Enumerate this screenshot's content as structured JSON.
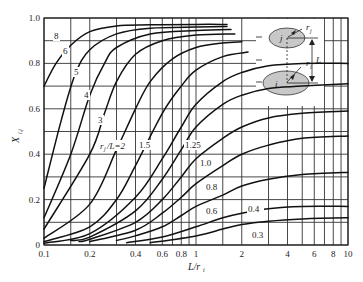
{
  "chart_data": {
    "type": "line",
    "title": "",
    "xlabel": "L/r_i",
    "ylabel": "X_i,j",
    "xscale": "log",
    "xlim": [
      0.1,
      10
    ],
    "ylim": [
      0,
      1.0
    ],
    "x_ticks": [
      "0.1",
      "0.2",
      "0.4",
      "0.6",
      "0.8",
      "1",
      "2",
      "4",
      "6",
      "8",
      "10"
    ],
    "y_ticks": [
      "0",
      "0.2",
      "0.4",
      "0.6",
      "0.8",
      "1.0"
    ],
    "grid": true,
    "legend_title": "r_j/L=2",
    "series": [
      {
        "name": "8",
        "x": [
          0.1,
          0.12,
          0.15,
          0.2,
          0.3,
          0.5,
          1,
          1.6
        ],
        "y": [
          0.7,
          0.8,
          0.88,
          0.94,
          0.965,
          0.97,
          0.972,
          0.972
        ]
      },
      {
        "name": "6",
        "x": [
          0.1,
          0.13,
          0.16,
          0.2,
          0.3,
          0.5,
          1,
          1.6
        ],
        "y": [
          0.25,
          0.55,
          0.75,
          0.86,
          0.93,
          0.955,
          0.96,
          0.962
        ]
      },
      {
        "name": "5",
        "x": [
          0.1,
          0.15,
          0.2,
          0.25,
          0.3,
          0.5,
          1,
          1.7
        ],
        "y": [
          0.12,
          0.4,
          0.66,
          0.8,
          0.87,
          0.93,
          0.945,
          0.95
        ]
      },
      {
        "name": "4",
        "x": [
          0.1,
          0.2,
          0.25,
          0.3,
          0.4,
          0.6,
          1,
          1.8
        ],
        "y": [
          0.07,
          0.4,
          0.58,
          0.72,
          0.84,
          0.9,
          0.925,
          0.93
        ]
      },
      {
        "name": "3",
        "x": [
          0.1,
          0.2,
          0.3,
          0.4,
          0.5,
          0.7,
          1,
          1.5,
          2
        ],
        "y": [
          0.03,
          0.18,
          0.42,
          0.6,
          0.72,
          0.82,
          0.87,
          0.89,
          0.895
        ]
      },
      {
        "name": "2",
        "x": [
          0.1,
          0.2,
          0.3,
          0.4,
          0.6,
          0.8,
          1,
          1.5,
          2.2
        ],
        "y": [
          0.015,
          0.08,
          0.2,
          0.35,
          0.58,
          0.7,
          0.77,
          0.83,
          0.85
        ]
      },
      {
        "name": "1.5",
        "x": [
          0.1,
          0.2,
          0.4,
          0.6,
          0.8,
          1,
          1.5,
          2,
          3,
          5,
          10
        ],
        "y": [
          0.008,
          0.05,
          0.21,
          0.38,
          0.52,
          0.62,
          0.72,
          0.76,
          0.79,
          0.8,
          0.8
        ]
      },
      {
        "name": "1.25",
        "x": [
          0.15,
          0.2,
          0.4,
          0.6,
          0.8,
          1,
          1.5,
          2,
          3,
          5,
          10
        ],
        "y": [
          0.02,
          0.035,
          0.15,
          0.29,
          0.42,
          0.52,
          0.62,
          0.66,
          0.69,
          0.7,
          0.71
        ]
      },
      {
        "name": "1.0",
        "x": [
          0.17,
          0.2,
          0.4,
          0.6,
          0.8,
          1,
          1.5,
          2,
          3,
          5,
          10
        ],
        "y": [
          0.015,
          0.025,
          0.1,
          0.2,
          0.3,
          0.38,
          0.47,
          0.52,
          0.56,
          0.58,
          0.59
        ]
      },
      {
        "name": "0.8",
        "x": [
          0.2,
          0.4,
          0.6,
          0.8,
          1,
          1.5,
          2,
          3,
          5,
          10
        ],
        "y": [
          0.015,
          0.065,
          0.14,
          0.21,
          0.27,
          0.35,
          0.4,
          0.44,
          0.47,
          0.48
        ]
      },
      {
        "name": "0.6",
        "x": [
          0.3,
          0.4,
          0.6,
          0.8,
          1,
          1.5,
          2,
          3,
          5,
          10
        ],
        "y": [
          0.02,
          0.04,
          0.08,
          0.13,
          0.17,
          0.22,
          0.26,
          0.29,
          0.31,
          0.32
        ]
      },
      {
        "name": "0.4",
        "x": [
          0.35,
          0.6,
          1,
          1.5,
          2,
          3,
          5,
          10
        ],
        "y": [
          0.01,
          0.035,
          0.08,
          0.12,
          0.14,
          0.16,
          0.17,
          0.17
        ]
      },
      {
        "name": "0.3",
        "x": [
          0.5,
          1,
          1.5,
          2,
          3,
          5,
          10
        ],
        "y": [
          0.01,
          0.04,
          0.07,
          0.09,
          0.105,
          0.115,
          0.12
        ]
      }
    ],
    "annotations": [
      "8",
      "6",
      "5",
      "4",
      "3",
      "r_j/L=2",
      "1.5",
      "1.25",
      "1.0",
      "0.8",
      "0.6",
      "0.4",
      "0.3"
    ]
  },
  "labels": {
    "ylabel": "X",
    "ylabel_sub": "i,j",
    "xlabel": "L/r",
    "xlabel_sub": "i",
    "legend_prefix": "r",
    "legend_mid": "/L=2",
    "inset": {
      "upper_disk": "j",
      "lower_disk": "i",
      "upper_radius": "r",
      "upper_radius_sub": "j",
      "lower_radius": "r",
      "lower_radius_sub": "i",
      "distance": "L"
    }
  },
  "colors": {
    "curve": "#111111",
    "grid": "#333333",
    "disk_fill": "#c8c8c8"
  }
}
